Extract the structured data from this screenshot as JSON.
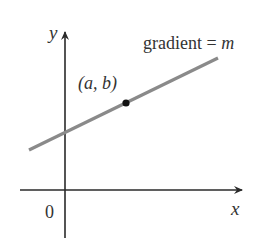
{
  "figure": {
    "y_axis_label": "y",
    "x_axis_label": "x",
    "origin_label": "0",
    "line_label_prefix": "gradient = ",
    "line_label_var": "m",
    "point_label": "(a, b)",
    "colors": {
      "axes": "#2a2a2a",
      "line": "#8a8a8a",
      "point": "#111111",
      "text": "#333333"
    }
  }
}
